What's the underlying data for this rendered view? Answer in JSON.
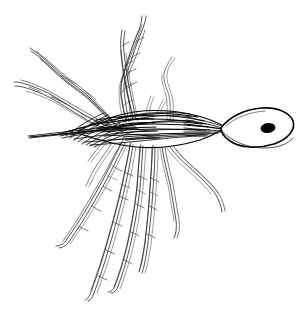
{
  "figure": {
    "medium": "black ink line drawing",
    "background_color": "#ffffff",
    "ink_color": "#000000",
    "canvas": {
      "width": 302,
      "height": 311
    },
    "labels": [],
    "caption": "",
    "scale_bar": ""
  },
  "subject": {
    "name": "setose-invertebrate",
    "orientation": "head to the right, body axis roughly horizontal",
    "parts": {
      "head": {
        "name": "head-capsule",
        "shape": "elongate lance-shaped oval",
        "fill": "#ffffff",
        "outline": "#000000",
        "center_x": 258,
        "center_y": 127,
        "length": 72,
        "width": 28
      },
      "eye": {
        "name": "eye-spot",
        "shape": "solid filled ellipse",
        "fill": "#000000",
        "center_x": 268,
        "center_y": 128,
        "width": 15,
        "height": 10
      },
      "trunk": {
        "name": "body-trunk",
        "shape": "dense cross-hatched horizontal spindle, tapering to a fine point at the left",
        "left_tip_x": 28,
        "right_end_x": 222,
        "axis_y": 128,
        "max_thickness": 34,
        "hatch_direction": "oblique, parallel to long axis"
      }
    },
    "appendages": {
      "name": "setae-bundles",
      "description": "twisted multi-strand filamentous setae radiating from the trunk",
      "count": 11,
      "render_style": "each bundle drawn as 3-4 interweaving wavy strands",
      "groups": [
        {
          "id": "upper-left-1",
          "direction": "upper-left",
          "tip_x": 30,
          "tip_y": 48,
          "twisted": true
        },
        {
          "id": "upper-left-2",
          "direction": "left",
          "tip_x": 14,
          "tip_y": 82,
          "twisted": true
        },
        {
          "id": "upper-mid-1",
          "direction": "up",
          "tip_x": 142,
          "tip_y": 16,
          "twisted": true
        },
        {
          "id": "upper-mid-2",
          "direction": "up",
          "tip_x": 122,
          "tip_y": 30,
          "twisted": true
        },
        {
          "id": "upper-right-1",
          "direction": "up, single fine strand",
          "tip_x": 172,
          "tip_y": 57,
          "twisted": false
        },
        {
          "id": "lower-left-1",
          "direction": "lower-left",
          "tip_x": 56,
          "tip_y": 246,
          "twisted": true
        },
        {
          "id": "lower-left-2",
          "direction": "down-left",
          "tip_x": 84,
          "tip_y": 300,
          "twisted": true
        },
        {
          "id": "lower-mid-1",
          "direction": "down",
          "tip_x": 108,
          "tip_y": 292,
          "twisted": true
        },
        {
          "id": "lower-mid-2",
          "direction": "down",
          "tip_x": 139,
          "tip_y": 272,
          "twisted": true
        },
        {
          "id": "lower-right-1",
          "direction": "down-right",
          "tip_x": 174,
          "tip_y": 238,
          "twisted": false
        },
        {
          "id": "lower-right-2",
          "direction": "lower-right",
          "tip_x": 222,
          "tip_y": 212,
          "twisted": false
        }
      ]
    }
  }
}
